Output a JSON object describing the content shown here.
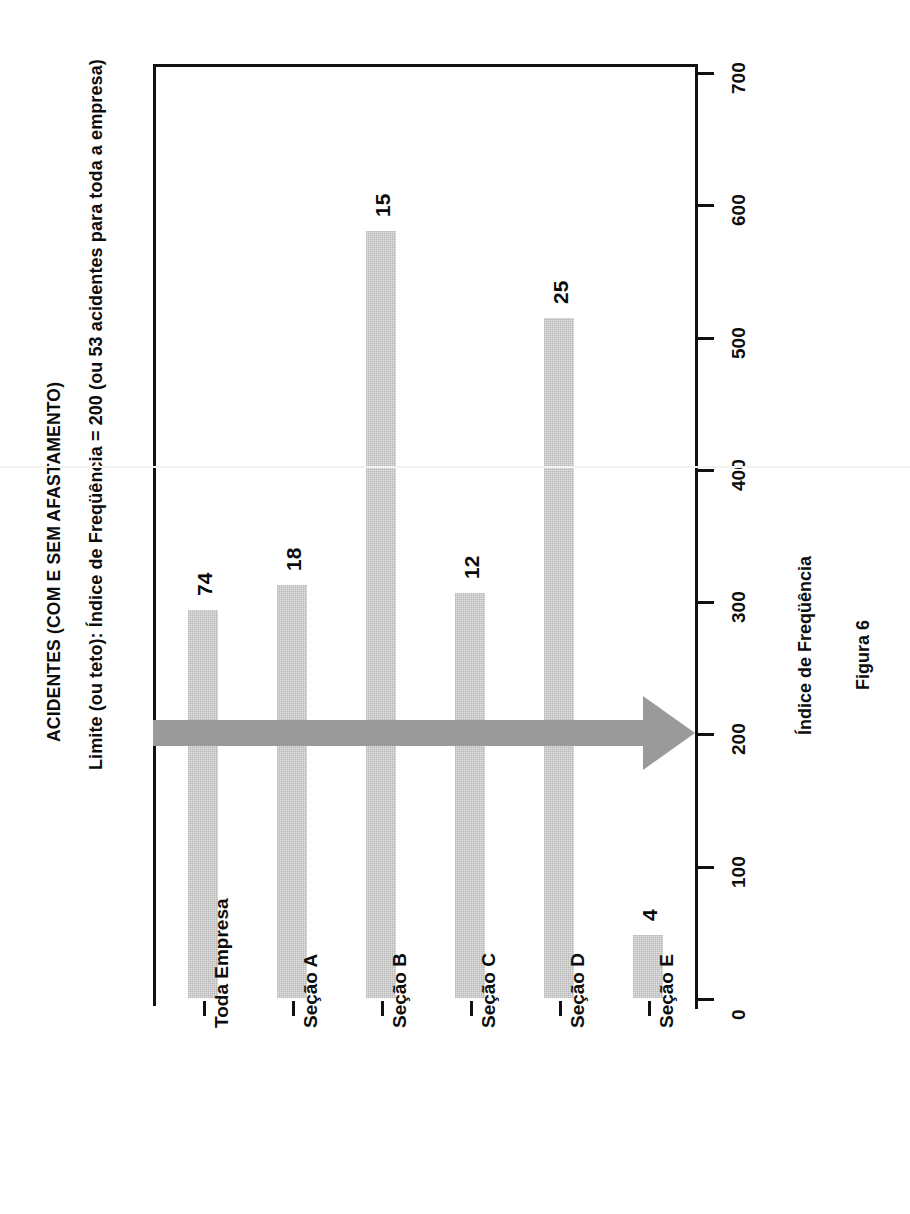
{
  "chart_data": {
    "type": "bar",
    "orientation": "horizontal",
    "title": "ACIDENTES (COM E SEM AFASTAMENTO)",
    "subtitle": "Limite (ou teto): Índice de Freqüência = 200 (ou 53 acidentes para toda a empresa)",
    "caption": "Figura 6",
    "xlabel": "Índice de Freqüência",
    "ylabel": "",
    "categories": [
      "Toda Empresa",
      "Seção A",
      "Seção B",
      "Seção C",
      "Seção D",
      "Seção E"
    ],
    "values": [
      293,
      312,
      580,
      306,
      514,
      48
    ],
    "data_labels": [
      "74",
      "18",
      "15",
      "12",
      "25",
      "4"
    ],
    "xlim": [
      0,
      700
    ],
    "xticks": [
      0,
      100,
      200,
      300,
      400,
      500,
      600,
      700
    ],
    "xtick_labels": [
      "0",
      "100",
      "200",
      "300",
      "400",
      "500",
      "600",
      "700"
    ],
    "grid": false,
    "legend": false,
    "bar_color": "#e2e2e2",
    "annotations": [
      {
        "name": "limit-arrow",
        "type": "arrow",
        "value": 200,
        "label": "",
        "color": "#9a9a9a"
      }
    ]
  },
  "colors": {
    "axis": "#111111",
    "bar_fill": "#e2e2e2",
    "arrow": "#9a9a9a",
    "text": "#0d0d0d",
    "background": "#ffffff"
  }
}
